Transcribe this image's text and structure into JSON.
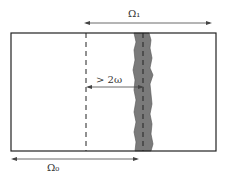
{
  "labels": {
    "omega1": "Ω₁",
    "omega0": "Ω₀",
    "distance": "> 2ω"
  },
  "colors": {
    "band_fill": "#7a7a7a",
    "line": "#222222"
  }
}
